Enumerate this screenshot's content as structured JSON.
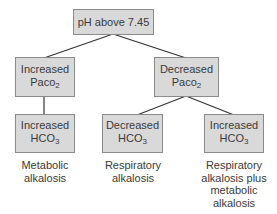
{
  "diagram": {
    "root": {
      "label": "pH above 7.45"
    },
    "level1": [
      {
        "line1": "Increased",
        "base": "Paco",
        "sub": "2"
      },
      {
        "line1": "Decreased",
        "base": "Paco",
        "sub": "2"
      }
    ],
    "level2": [
      {
        "line1": "Increased",
        "base": "HCO",
        "sub": "3",
        "caption": [
          "Metabolic",
          "alkalosis"
        ]
      },
      {
        "line1": "Decreased",
        "base": "HCO",
        "sub": "3",
        "caption": [
          "Respiratory",
          "alkalosis"
        ]
      },
      {
        "line1": "Increased",
        "base": "HCO",
        "sub": "3",
        "caption": [
          "Respiratory",
          "alkalosis plus",
          "metabolic",
          "alkalosis"
        ]
      }
    ],
    "colors": {
      "box_fill": "#d9d9d9",
      "box_border": "#8a8a8a",
      "line": "#333333"
    }
  }
}
